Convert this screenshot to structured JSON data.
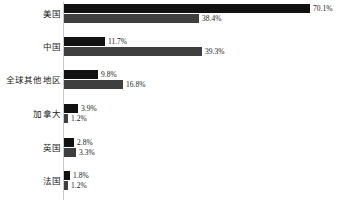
{
  "chart_data": {
    "type": "bar",
    "orientation": "horizontal",
    "title": "",
    "subtitle": "",
    "xlabel": "",
    "ylabel": "",
    "grid": false,
    "legend": "none",
    "axis_line": true,
    "value_label_suffix": "%",
    "xlim": [
      0,
      70.1
    ],
    "categories": [
      "美国",
      "中国",
      "全球其他地区",
      "加拿大",
      "英国",
      "法国"
    ],
    "series": [
      {
        "name": "series-1",
        "color": "#111111",
        "values": [
          70.1,
          11.7,
          9.8,
          3.9,
          2.8,
          1.8
        ],
        "labels": [
          "70.1%",
          "11.7%",
          "9.8%",
          "3.9%",
          "2.8%",
          "1.8%"
        ]
      },
      {
        "name": "series-2",
        "color": "#3f3f3f",
        "values": [
          38.4,
          39.3,
          16.8,
          1.2,
          3.3,
          1.2
        ],
        "labels": [
          "38.4%",
          "39.3%",
          "16.8%",
          "1.2%",
          "3.3%",
          "1.2%"
        ]
      }
    ]
  },
  "layout": {
    "plot_left": 64,
    "px_per_unit": 3.512,
    "bar_height": 9,
    "group_top": [
      4,
      37,
      70,
      104,
      138,
      171
    ],
    "axis_color": "#c9c9c9",
    "background": "#ffffff"
  }
}
